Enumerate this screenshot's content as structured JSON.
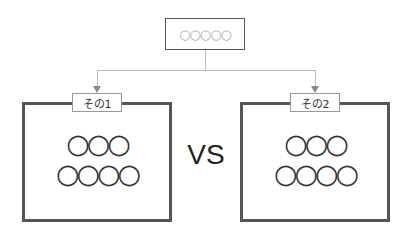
{
  "top": {
    "text": "○○○○○"
  },
  "vs": "VS",
  "panels": [
    {
      "label": "その1",
      "row1": "○○○",
      "row2": "○○○○"
    },
    {
      "label": "その2",
      "row1": "○○○",
      "row2": "○○○○"
    }
  ]
}
